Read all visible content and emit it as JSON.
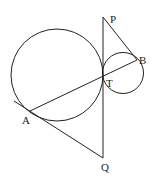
{
  "diagram": {
    "labels": {
      "P": "P",
      "B": "B",
      "T": "T",
      "A": "A",
      "Q": "Q"
    },
    "points": {
      "P": [
        103,
        17
      ],
      "B": [
        137,
        60
      ],
      "T": [
        103,
        78
      ],
      "A": [
        30,
        111
      ],
      "Q": [
        103,
        158
      ]
    },
    "circles": [
      {
        "name": "large-circle",
        "cx": 57,
        "cy": 75,
        "r": 46
      },
      {
        "name": "small-circle",
        "cx": 123,
        "cy": 73,
        "r": 20.5
      }
    ],
    "segments": [
      {
        "name": "PQ",
        "from": "P",
        "to": "Q"
      },
      {
        "name": "PB",
        "from": "P",
        "to": "B"
      },
      {
        "name": "AB",
        "from": "A",
        "to": "B"
      },
      {
        "name": "QA-extended",
        "from": "Q",
        "to": "A"
      }
    ],
    "colors": {
      "stroke": "#222222",
      "background": "#ffffff"
    }
  }
}
